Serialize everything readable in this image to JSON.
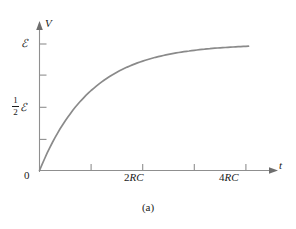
{
  "figure": {
    "caption": "(a)",
    "axis_color": "#8f8f8f",
    "curve_color": "#8a8a8a",
    "text_color": "#1a1a1a",
    "background": "#ffffff"
  },
  "labels": {
    "y_axis_name": "V",
    "x_axis_name": "t",
    "origin": "0",
    "emf_symbol": "ℰ",
    "half_numerator": "1",
    "half_denominator": "2",
    "xtick_2rc_number": "2",
    "xtick_2rc_unit": "RC",
    "xtick_4rc_number": "4",
    "xtick_4rc_unit": "RC"
  },
  "chart_data": {
    "type": "line",
    "title": "",
    "subtitle": "",
    "xlabel": "t",
    "ylabel": "V",
    "equation": "V = ℰ(1 − e^(−t/RC))",
    "grid": false,
    "legend": null,
    "xlim": [
      0,
      4.6
    ],
    "ylim": [
      0,
      1.08
    ],
    "xlim_units": "RC",
    "ylim_units": "emf",
    "x_ticks": [
      {
        "value": 1,
        "label": ""
      },
      {
        "value": 2,
        "label": "2RC"
      },
      {
        "value": 3,
        "label": ""
      },
      {
        "value": 4,
        "label": "4RC"
      }
    ],
    "y_ticks": [
      {
        "value": 0.25,
        "label": ""
      },
      {
        "value": 0.5,
        "label": "½ℰ"
      },
      {
        "value": 0.75,
        "label": ""
      },
      {
        "value": 1.0,
        "label": "ℰ"
      }
    ],
    "series": [
      {
        "name": "V(t)",
        "x": [
          0,
          0.1,
          0.2,
          0.3,
          0.4,
          0.5,
          0.6,
          0.7,
          0.8,
          0.9,
          1.0,
          1.2,
          1.4,
          1.6,
          1.8,
          2.0,
          2.2,
          2.4,
          2.6,
          2.8,
          3.0,
          3.2,
          3.4,
          3.6,
          3.8,
          4.0,
          4.2
        ],
        "y": [
          0.0,
          0.095,
          0.181,
          0.259,
          0.33,
          0.393,
          0.451,
          0.503,
          0.551,
          0.593,
          0.632,
          0.699,
          0.753,
          0.798,
          0.835,
          0.865,
          0.889,
          0.909,
          0.926,
          0.939,
          0.95,
          0.959,
          0.967,
          0.973,
          0.978,
          0.982,
          0.985
        ]
      }
    ],
    "annotations": [
      {
        "text": "0",
        "x": 0,
        "y": 0,
        "role": "origin"
      },
      {
        "text": "ℰ",
        "x": 0,
        "y": 1.0,
        "role": "y-tick-label"
      },
      {
        "text": "½ℰ",
        "x": 0,
        "y": 0.5,
        "role": "y-tick-label"
      }
    ]
  }
}
